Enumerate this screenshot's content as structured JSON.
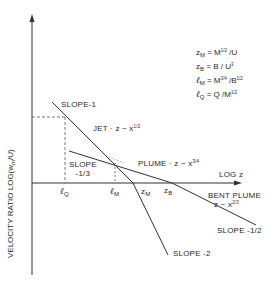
{
  "diagram": {
    "y_axis_label": "VELOCITY RATIO LOG(w",
    "y_axis_label_sub": "m",
    "y_axis_label_end": "/U)",
    "x_axis_label": "LOG z",
    "definitions": [
      {
        "sym": "z",
        "sub": "M",
        "eq": " = M",
        "sup": "1/2",
        "rest": " /U"
      },
      {
        "sym": "z",
        "sub": "B",
        "eq": " = B / U",
        "sup": "3",
        "rest": ""
      },
      {
        "sym": "ℓ",
        "sub": "M",
        "eq": " = M",
        "sup": "3/4",
        "rest": " /B",
        "sup2": "1/2"
      },
      {
        "sym": "ℓ",
        "sub": "Q",
        "eq": " = Q /M",
        "sup": "1/2",
        "rest": ""
      }
    ],
    "line_labels": {
      "slope_1": "SLOPE-1",
      "jet": "JET · z ~ x",
      "jet_exp": "1/2",
      "slope_1_3_a": "SLOPE",
      "slope_1_3_b": "-1/3",
      "plume": "PLUME · z ~ x",
      "plume_exp": "3/4",
      "bent_plume": "BENT PLUME",
      "bent_plume_rel": "z ~ x",
      "bent_plume_exp": "2/3",
      "slope_1_2": "SLOPE -1/2",
      "slope_2": "SLOPE -2"
    },
    "x_ticks": [
      {
        "sym": "ℓ",
        "sub": "Q"
      },
      {
        "sym": "ℓ",
        "sub": "M"
      },
      {
        "sym": "z",
        "sub": "M"
      },
      {
        "sym": "z",
        "sub": "B"
      }
    ],
    "colors": {
      "line": "#333333",
      "dash": "#555555",
      "background": "#ffffff"
    }
  }
}
